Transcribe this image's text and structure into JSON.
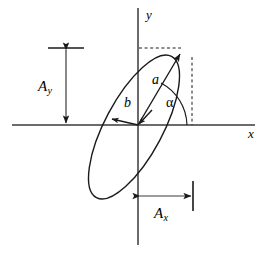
{
  "figure": {
    "background_color": "#ffffff",
    "stroke_color": "#1a1a1a"
  },
  "axes": {
    "x_label": "x",
    "y_label": "y",
    "origin": {
      "x": 138,
      "y": 125
    },
    "x_axis": {
      "x1": 12,
      "y1": 125,
      "x2": 255,
      "y2": 125
    },
    "y_axis": {
      "x1": 138,
      "y1": 8,
      "x2": 138,
      "y2": 245
    }
  },
  "ellipse": {
    "center": {
      "x": 134,
      "y": 127
    },
    "semi_major": 80,
    "semi_minor": 29,
    "rotation_deg": -62
  },
  "vectors": {
    "semi_major_label": "a",
    "semi_minor_label": "b",
    "angle_label": "α"
  },
  "amplitudes": {
    "y_label": "A",
    "y_sub": "y",
    "x_label": "A",
    "x_sub": "x"
  },
  "guides": {
    "dashed_horizontal": {
      "x1": 139,
      "y1": 48,
      "x2": 181,
      "y2": 48
    },
    "dashed_vertical": {
      "x1": 192,
      "y1": 57,
      "x2": 192,
      "y2": 125
    }
  }
}
